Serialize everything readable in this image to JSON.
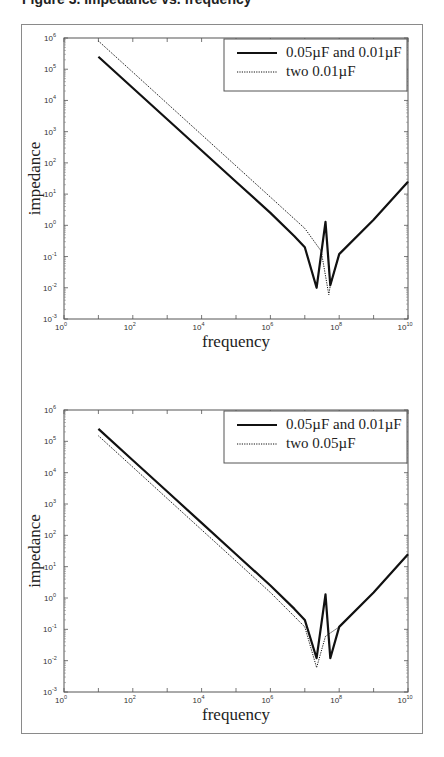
{
  "caption": "Figure 3. Impedance vs. frequency",
  "chart_data": [
    {
      "type": "line",
      "title": "",
      "xlabel": "frequency",
      "ylabel": "impedance",
      "xscale": "log",
      "yscale": "log",
      "xlim": [
        1,
        10000000000
      ],
      "ylim": [
        0.001,
        1000000
      ],
      "x_ticks": [
        "10^0",
        "10^2",
        "10^4",
        "10^6",
        "10^8",
        "10^10"
      ],
      "y_ticks": [
        "10^-3",
        "10^-2",
        "10^-1",
        "10^0",
        "10^1",
        "10^2",
        "10^3",
        "10^4",
        "10^5",
        "10^6"
      ],
      "grid": false,
      "legend_position": "upper right",
      "series": [
        {
          "name": "0.05µF and 0.01µF",
          "style": "solid",
          "x": [
            10,
            100,
            1000,
            10000,
            100000,
            1000000,
            5000000,
            10000000,
            22000000,
            40000000,
            55000000,
            100000000,
            1000000000,
            10000000000
          ],
          "y": [
            250000,
            25000,
            2500,
            250,
            25,
            2.5,
            0.45,
            0.2,
            0.01,
            1.3,
            0.012,
            0.12,
            1.5,
            25
          ]
        },
        {
          "name": "two 0.01µF",
          "style": "dotted",
          "x": [
            10,
            100,
            1000,
            10000,
            100000,
            1000000,
            10000000,
            30000000,
            50000000,
            55000000,
            100000000,
            1000000000,
            10000000000
          ],
          "y": [
            800000,
            80000,
            8000,
            800,
            80,
            8,
            0.8,
            0.15,
            0.006,
            0.012,
            0.12,
            1.5,
            25
          ]
        }
      ]
    },
    {
      "type": "line",
      "title": "",
      "xlabel": "frequency",
      "ylabel": "impedance",
      "xscale": "log",
      "yscale": "log",
      "xlim": [
        1,
        10000000000
      ],
      "ylim": [
        0.001,
        1000000
      ],
      "x_ticks": [
        "10^0",
        "10^2",
        "10^4",
        "10^6",
        "10^8",
        "10^10"
      ],
      "y_ticks": [
        "10^-3",
        "10^-2",
        "10^-1",
        "10^0",
        "10^1",
        "10^2",
        "10^3",
        "10^4",
        "10^5",
        "10^6"
      ],
      "grid": false,
      "legend_position": "upper right",
      "series": [
        {
          "name": "0.05µF and 0.01µF",
          "style": "solid",
          "x": [
            10,
            100,
            1000,
            10000,
            100000,
            1000000,
            5000000,
            10000000,
            22000000,
            40000000,
            55000000,
            100000000,
            1000000000,
            10000000000
          ],
          "y": [
            250000,
            25000,
            2500,
            250,
            25,
            2.5,
            0.45,
            0.2,
            0.012,
            1.3,
            0.012,
            0.12,
            1.5,
            25
          ]
        },
        {
          "name": "two 0.05µF",
          "style": "dotted",
          "x": [
            10,
            100,
            1000,
            10000,
            100000,
            1000000,
            10000000,
            22000000,
            40000000,
            100000000,
            1000000000,
            10000000000
          ],
          "y": [
            150000,
            15000,
            1500,
            150,
            15,
            1.5,
            0.12,
            0.006,
            0.06,
            0.12,
            1.5,
            25
          ]
        }
      ]
    }
  ]
}
